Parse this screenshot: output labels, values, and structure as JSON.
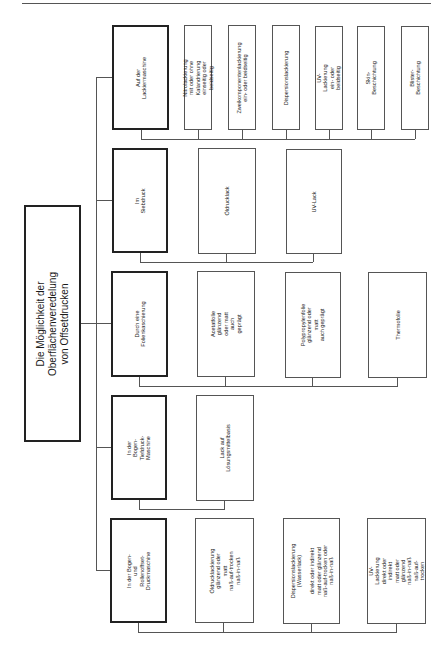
{
  "title": "Die Möglichkeit der Oberflächenveredelung\nvon Offsetdrucken",
  "rows": [
    {
      "category": "Auf der Lackiermaschine",
      "items": [
        "Nitrolackierung\nmit oder ohne Kalandrierung\neinseitig oder beidseitig",
        "Zweikomponentenlackierung\nein- oder beidseitig",
        "Dispersionslackierung",
        "UV-Lackierung\nein- oder beidseitig",
        "Skin-Beschichtung",
        "Blister-Beschichtung"
      ]
    },
    {
      "category": "Im Siebdruck",
      "items": [
        "Öldrucklack",
        "UV-Lack"
      ]
    },
    {
      "category": "Durch eine\nFolienkaschierung",
      "items": [
        "Acetatfolie\nglänzend oder matt\nauch geprägt",
        "Polypropylenfolie\nglänzend oder matt\nauch geprägt",
        "Thermofolie"
      ]
    },
    {
      "category": "In der\nBogen-Tiefdruck-Maschine",
      "items": [
        "Lack auf Lösungsmittelbasis"
      ]
    },
    {
      "category": "In der Bogen- und\nRollenoffset-Druckmaschine",
      "items": [
        "Öldrucklackierung\nglänzend oder matt\nnaß-auf-trocken\nnaß-in-naß",
        "Dispersionslackierung\n(Wasserlack)\n\ndirekt oder indirekt\nmatt oder glänzend\nnaß-auf-trocken oder\nnaß-in-naß",
        "UV-Lackierung\ndirekt oder indirekt\nmatt oder glänzend\nnaß-in-naß\nnaß-auf-trocken"
      ]
    }
  ]
}
